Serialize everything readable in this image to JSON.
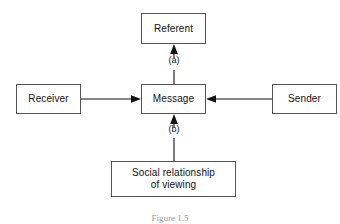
{
  "figure": {
    "caption": "Figure 1.5",
    "background_color": "#ffffff",
    "line_color": "#111111",
    "box_border_color": "#555555",
    "text_color": "#111111"
  },
  "nodes": [
    {
      "id": "referent",
      "label": "Referent",
      "x": 141,
      "y": 13,
      "width": 65,
      "height": 31
    },
    {
      "id": "receiver",
      "label": "Receiver",
      "x": 16,
      "y": 84,
      "width": 65,
      "height": 30
    },
    {
      "id": "message",
      "label": "Message",
      "x": 141,
      "y": 84,
      "width": 65,
      "height": 30
    },
    {
      "id": "sender",
      "label": "Sender",
      "x": 272,
      "y": 84,
      "width": 65,
      "height": 30
    },
    {
      "id": "social-relationship",
      "label": "Social relationship\nof viewing",
      "x": 111,
      "y": 161,
      "width": 125,
      "height": 36
    }
  ],
  "edges": [
    {
      "id": "message-to-referent",
      "from": "message",
      "to": "referent",
      "label": "(a)",
      "direction": "up",
      "label_x": 173,
      "label_y": 60
    },
    {
      "id": "receiver-to-message",
      "from": "receiver",
      "to": "message",
      "label": "",
      "direction": "right"
    },
    {
      "id": "sender-to-message",
      "from": "sender",
      "to": "message",
      "label": "",
      "direction": "left"
    },
    {
      "id": "social-relationship-to-message",
      "from": "social-relationship",
      "to": "message",
      "label": "(b)",
      "direction": "up",
      "label_x": 173,
      "label_y": 129
    }
  ]
}
